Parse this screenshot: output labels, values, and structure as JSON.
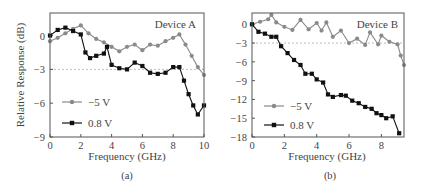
{
  "chart_data": [
    {
      "type": "line",
      "panel": "(a)",
      "title": "Device A",
      "xlabel": "Frequency (GHz)",
      "ylabel": "Relative Response (dB)",
      "xlim": [
        0,
        10
      ],
      "ylim": [
        -9,
        2
      ],
      "xticks": [
        0,
        2,
        4,
        6,
        8,
        10
      ],
      "yticks": [
        0,
        -3,
        -6,
        -9
      ],
      "ytick_labels": [
        "0",
        "−3",
        "−6",
        "−9"
      ],
      "reference_line": -3,
      "grid": false,
      "legend_position": "lower left",
      "series": [
        {
          "name": "−5 V",
          "color": "#8a8a8a",
          "marker": "circle",
          "x": [
            0,
            0.5,
            1,
            1.5,
            2,
            2.5,
            3,
            3.5,
            4,
            4.5,
            5,
            5.5,
            6,
            6.5,
            7,
            7.5,
            8,
            8.4,
            8.8,
            9.2,
            9.6,
            10
          ],
          "y": [
            -0.5,
            -0.2,
            0.2,
            0.6,
            0.9,
            0.2,
            -0.3,
            -0.6,
            -1.0,
            -1.4,
            -1.0,
            -0.8,
            -1.3,
            -0.8,
            -0.9,
            -0.5,
            -0.2,
            0.1,
            -0.8,
            -1.8,
            -2.8,
            -3.5
          ]
        },
        {
          "name": "0.8 V",
          "color": "#111111",
          "marker": "square",
          "x": [
            0,
            0.5,
            1,
            1.5,
            2,
            2.3,
            2.6,
            3,
            3.5,
            3.7,
            4,
            4.5,
            5,
            5.5,
            6,
            6.5,
            7,
            7.5,
            8,
            8.4,
            8.7,
            9,
            9.3,
            9.6,
            10
          ],
          "y": [
            0,
            0.5,
            0.7,
            0.4,
            0.1,
            -1.5,
            -2.0,
            -1.8,
            -1.6,
            -1.0,
            -2.6,
            -2.9,
            -3.0,
            -2.4,
            -2.7,
            -3.3,
            -3.4,
            -3.3,
            -2.8,
            -2.8,
            -4.0,
            -5.2,
            -6.2,
            -7.0,
            -6.2
          ]
        }
      ]
    },
    {
      "type": "line",
      "panel": "(b)",
      "title": "Device B",
      "xlabel": "Frequency (GHz)",
      "ylabel": "",
      "xlim": [
        0,
        9.4
      ],
      "ylim": [
        -18,
        1.8
      ],
      "xticks": [
        0,
        2,
        4,
        6,
        8
      ],
      "yticks": [
        0,
        -3,
        -6,
        -9,
        -12,
        -15,
        -18
      ],
      "ytick_labels": [
        "0",
        "−3",
        "−6",
        "−9",
        "−12",
        "−15",
        "−18"
      ],
      "reference_line": -3,
      "grid": false,
      "legend_position": "lower left",
      "series": [
        {
          "name": "−5 V",
          "color": "#8a8a8a",
          "marker": "circle",
          "x": [
            0,
            0.5,
            1,
            1.2,
            1.5,
            2,
            2.5,
            3,
            3.5,
            4,
            4.3,
            4.6,
            5,
            5.5,
            6,
            6.5,
            7,
            7.3,
            7.8,
            8,
            8.5,
            9,
            9.2,
            9.4
          ],
          "y": [
            0,
            0.4,
            0.8,
            1.5,
            0.3,
            -0.4,
            -0.9,
            0.7,
            -0.8,
            0.2,
            -1.0,
            0.3,
            -2.0,
            -1.0,
            -3.0,
            -2.3,
            -3.3,
            -1.3,
            -3.2,
            -1.8,
            -2.8,
            -3.2,
            -5.0,
            -6.5
          ]
        },
        {
          "name": "0.8 V",
          "color": "#111111",
          "marker": "square",
          "x": [
            0,
            0.4,
            0.8,
            1.2,
            1.5,
            1.8,
            2.2,
            2.6,
            3,
            3.3,
            3.7,
            4,
            4.4,
            4.7,
            5,
            5.5,
            5.8,
            6.2,
            6.6,
            7,
            7.4,
            7.7,
            8,
            8.3,
            8.7,
            9.1
          ],
          "y": [
            0,
            -1.2,
            -1.5,
            -2.0,
            -2.0,
            -3.5,
            -4.6,
            -5.7,
            -6.5,
            -7.9,
            -7.9,
            -8.8,
            -9.3,
            -11.2,
            -11.6,
            -11.3,
            -11.4,
            -12.2,
            -12.6,
            -13.2,
            -13.5,
            -14.2,
            -14.5,
            -15.0,
            -14.7,
            -17.4
          ]
        }
      ]
    }
  ],
  "panels": {
    "a": {
      "device_label": "Device A",
      "caption": "(a)",
      "xlabel": "Frequency (GHz)",
      "ylabel": "Relative Response (dB)",
      "legend": [
        "−5 V",
        "0.8 V"
      ]
    },
    "b": {
      "device_label": "Device B",
      "caption": "(b)",
      "xlabel": "Frequency (GHz)",
      "legend": [
        "−5 V",
        "0.8 V"
      ]
    }
  }
}
